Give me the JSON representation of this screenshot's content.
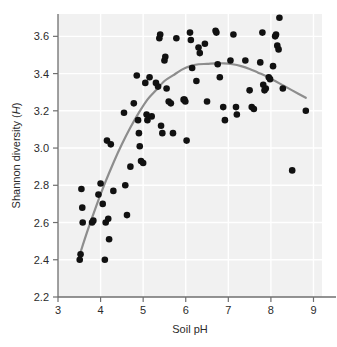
{
  "chart_data": {
    "type": "scatter",
    "title": "",
    "xlabel": "Soil pH",
    "ylabel": "Shannon diversity (H)",
    "ylabel_plain": "Shannon diversity (",
    "ylabel_italic": "H",
    "ylabel_close": ")",
    "xlim": [
      3,
      9.2
    ],
    "ylim": [
      2.2,
      3.72
    ],
    "xticks": [
      3,
      4,
      5,
      6,
      7,
      8,
      9
    ],
    "xtick_labels": [
      "3",
      "4",
      "5",
      "6",
      "7",
      "8",
      "9"
    ],
    "yticks": [
      2.2,
      2.4,
      2.6,
      2.8,
      3.0,
      3.2,
      3.4,
      3.6
    ],
    "ytick_labels": [
      "2.2",
      "2.4",
      "2.6",
      "2.8",
      "3.0",
      "3.2",
      "3.4",
      "3.6"
    ],
    "grid": true,
    "grid_color": "#ffffff",
    "plot_background": "#f1f1f1",
    "marker_color": "#111111",
    "marker_size": 4.6,
    "axis_color": "#6f6f6f",
    "legend": null,
    "points": [
      [
        3.51,
        2.4
      ],
      [
        3.53,
        2.43
      ],
      [
        3.55,
        2.78
      ],
      [
        3.57,
        2.68
      ],
      [
        3.58,
        2.6
      ],
      [
        3.8,
        2.6
      ],
      [
        3.83,
        2.61
      ],
      [
        3.95,
        2.75
      ],
      [
        4.0,
        2.81
      ],
      [
        4.05,
        2.7
      ],
      [
        4.1,
        2.4
      ],
      [
        4.12,
        2.6
      ],
      [
        4.15,
        3.04
      ],
      [
        4.18,
        2.62
      ],
      [
        4.2,
        2.51
      ],
      [
        4.24,
        3.02
      ],
      [
        4.3,
        2.77
      ],
      [
        4.55,
        3.19
      ],
      [
        4.58,
        2.8
      ],
      [
        4.62,
        2.64
      ],
      [
        4.7,
        2.9
      ],
      [
        4.78,
        3.24
      ],
      [
        4.85,
        3.39
      ],
      [
        4.88,
        3.15
      ],
      [
        4.9,
        3.08
      ],
      [
        4.92,
        3.01
      ],
      [
        4.95,
        2.93
      ],
      [
        5.0,
        2.92
      ],
      [
        5.05,
        3.35
      ],
      [
        5.08,
        3.18
      ],
      [
        5.1,
        3.15
      ],
      [
        5.15,
        3.38
      ],
      [
        5.2,
        3.17
      ],
      [
        5.3,
        3.35
      ],
      [
        5.35,
        3.33
      ],
      [
        5.38,
        3.59
      ],
      [
        5.4,
        3.61
      ],
      [
        5.42,
        3.12
      ],
      [
        5.45,
        3.08
      ],
      [
        5.5,
        3.47
      ],
      [
        5.52,
        3.49
      ],
      [
        5.55,
        3.32
      ],
      [
        5.6,
        3.25
      ],
      [
        5.65,
        3.24
      ],
      [
        5.7,
        3.08
      ],
      [
        5.78,
        3.59
      ],
      [
        5.95,
        3.26
      ],
      [
        5.97,
        3.26
      ],
      [
        5.99,
        3.25
      ],
      [
        6.02,
        3.04
      ],
      [
        6.1,
        3.62
      ],
      [
        6.12,
        3.58
      ],
      [
        6.15,
        3.43
      ],
      [
        6.25,
        3.36
      ],
      [
        6.3,
        3.54
      ],
      [
        6.33,
        3.51
      ],
      [
        6.45,
        3.56
      ],
      [
        6.5,
        3.25
      ],
      [
        6.7,
        3.63
      ],
      [
        6.72,
        3.62
      ],
      [
        6.75,
        3.45
      ],
      [
        6.8,
        3.38
      ],
      [
        6.88,
        3.22
      ],
      [
        6.92,
        3.15
      ],
      [
        7.05,
        3.47
      ],
      [
        7.12,
        3.61
      ],
      [
        7.18,
        3.22
      ],
      [
        7.2,
        3.18
      ],
      [
        7.4,
        3.47
      ],
      [
        7.5,
        3.31
      ],
      [
        7.55,
        3.22
      ],
      [
        7.6,
        3.21
      ],
      [
        7.75,
        3.46
      ],
      [
        7.8,
        3.62
      ],
      [
        7.82,
        3.34
      ],
      [
        7.85,
        3.31
      ],
      [
        7.88,
        3.32
      ],
      [
        7.95,
        3.38
      ],
      [
        7.98,
        3.37
      ],
      [
        8.05,
        3.44
      ],
      [
        8.1,
        3.6
      ],
      [
        8.12,
        3.61
      ],
      [
        8.15,
        3.55
      ],
      [
        8.18,
        3.53
      ],
      [
        8.2,
        3.7
      ],
      [
        8.28,
        3.32
      ],
      [
        8.5,
        2.88
      ],
      [
        8.82,
        3.2
      ]
    ],
    "fit_curve": {
      "name": "smoothed-trend",
      "color": "#8d8d8d",
      "width": 2.2,
      "points": [
        [
          3.5,
          2.42
        ],
        [
          3.7,
          2.56
        ],
        [
          3.9,
          2.69
        ],
        [
          4.1,
          2.81
        ],
        [
          4.3,
          2.92
        ],
        [
          4.5,
          3.02
        ],
        [
          4.7,
          3.11
        ],
        [
          4.9,
          3.19
        ],
        [
          5.1,
          3.26
        ],
        [
          5.3,
          3.31
        ],
        [
          5.5,
          3.36
        ],
        [
          5.7,
          3.39
        ],
        [
          5.9,
          3.42
        ],
        [
          6.1,
          3.44
        ],
        [
          6.3,
          3.45
        ],
        [
          6.5,
          3.452
        ],
        [
          6.7,
          3.455
        ],
        [
          6.9,
          3.455
        ],
        [
          7.1,
          3.45
        ],
        [
          7.3,
          3.44
        ],
        [
          7.5,
          3.425
        ],
        [
          7.7,
          3.405
        ],
        [
          7.9,
          3.385
        ],
        [
          8.1,
          3.36
        ],
        [
          8.3,
          3.335
        ],
        [
          8.5,
          3.31
        ],
        [
          8.82,
          3.27
        ]
      ]
    }
  }
}
